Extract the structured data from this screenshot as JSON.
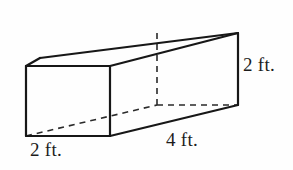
{
  "figure": {
    "type": "rectangular-prism",
    "shape_name": "rectangular prism",
    "background_color": "#fefefe",
    "stroke_color": "#1c1c1c",
    "label_color": "#1c1c1c"
  },
  "labels": {
    "width": "2 ft.",
    "length": "4 ft.",
    "height": "2 ft."
  },
  "dimensions": {
    "width_value": 2,
    "length_value": 4,
    "height_value": 2,
    "unit": "ft."
  },
  "geometry": {
    "front_face": {
      "top_left": [
        26,
        66
      ],
      "top_right": [
        110,
        66
      ],
      "bottom_right": [
        110,
        136
      ],
      "bottom_left": [
        26,
        136
      ]
    },
    "back_face": {
      "top_left": [
        157,
        33
      ],
      "top_right": [
        238,
        33
      ],
      "bottom_right": [
        238,
        105
      ],
      "bottom_left": [
        157,
        105
      ]
    },
    "left_back_top": [
      40,
      58
    ],
    "hidden_edges": [
      "back-vertical-left",
      "bottom-back-left-diagonal",
      "bottom-back-horizontal"
    ]
  }
}
